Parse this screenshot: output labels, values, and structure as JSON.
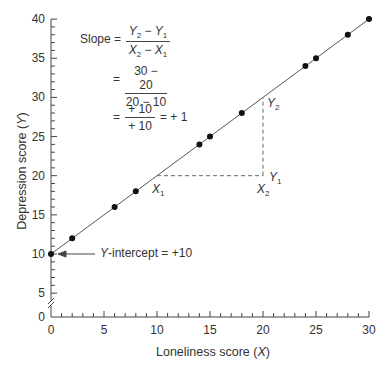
{
  "chart_data": {
    "type": "scatter",
    "title": "",
    "xlabel": "Loneliness score (X)",
    "ylabel": "Depression score (Y)",
    "xlim": [
      0,
      30
    ],
    "ylim": [
      0,
      40
    ],
    "x_ticks": [
      0,
      5,
      10,
      15,
      20,
      25,
      30
    ],
    "y_ticks": [
      0,
      5,
      10,
      15,
      20,
      25,
      30,
      35,
      40
    ],
    "y_axis_break": true,
    "grid": false,
    "series": [
      {
        "name": "Observations",
        "points": [
          {
            "x": 0,
            "y": 10
          },
          {
            "x": 2,
            "y": 12
          },
          {
            "x": 6,
            "y": 16
          },
          {
            "x": 8,
            "y": 18
          },
          {
            "x": 14,
            "y": 24
          },
          {
            "x": 15,
            "y": 25
          },
          {
            "x": 18,
            "y": 28
          },
          {
            "x": 24,
            "y": 34
          },
          {
            "x": 25,
            "y": 35
          },
          {
            "x": 28,
            "y": 38
          },
          {
            "x": 30,
            "y": 40
          }
        ]
      }
    ],
    "regression_line": {
      "slope": 1,
      "intercept": 10,
      "x_range": [
        0,
        30
      ]
    },
    "slope_triangle": {
      "x1": 10,
      "y1": 20,
      "x2": 20,
      "y2": 30
    },
    "annotations": {
      "slope_label": "Slope =",
      "formula_num": "Y2 − Y1",
      "formula_den": "X2 − X1",
      "step2_num": "30 − 20",
      "step2_den": "20 − 10",
      "step3_num": "+ 10",
      "step3_den": "+ 10",
      "step3_result": "= + 1",
      "equals": "=",
      "intercept_label": "Y-intercept = +10",
      "point_labels": [
        "X1",
        "Y1",
        "X2",
        "Y2"
      ]
    }
  },
  "labels": {
    "xlabel_main": "Loneliness score (",
    "xlabel_var": "X",
    "xlabel_end": ")",
    "ylabel_main": "Depression score (",
    "ylabel_var": "Y",
    "ylabel_end": ")",
    "slope": "Slope =",
    "eq": "=",
    "f1_num_a": "Y",
    "f1_num_a_sub": "2",
    "f1_num_b": "Y",
    "f1_num_b_sub": "1",
    "f1_den_a": "X",
    "f1_den_a_sub": "2",
    "f1_den_b": "X",
    "f1_den_b_sub": "1",
    "minus": " − ",
    "f2_num": "30 − 20",
    "f2_den": "20 − 10",
    "f3_num": "+ 10",
    "f3_den": "+ 10",
    "f3_result": "= + 1",
    "intercept_var": "Y",
    "intercept_rest": "-intercept = +10",
    "pt_x1": "X",
    "pt_x1_sub": "1",
    "pt_y1": "Y",
    "pt_y1_sub": "1",
    "pt_x2": "X",
    "pt_x2_sub": "2",
    "pt_y2": "Y",
    "pt_y2_sub": "2"
  }
}
